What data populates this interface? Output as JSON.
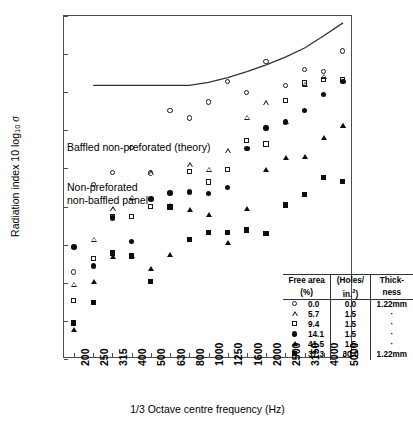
{
  "chart_data": {
    "type": "scatter",
    "title": "",
    "xlabel": "1/3 Octave centre frequency (Hz)",
    "ylabel_parts": {
      "pre": "Radiation index 10 log",
      "sub": "10",
      "sym": "σ"
    },
    "ylabel": "Radiation index 10 log10 σ",
    "categories": [
      200,
      250,
      315,
      400,
      500,
      630,
      800,
      1000,
      1250,
      1600,
      2000,
      2500,
      3150,
      4000,
      5000
    ],
    "xtick_labels": [
      "200",
      "250",
      "315",
      "400",
      "500",
      "630",
      "800",
      "1000",
      "1250",
      "1600",
      "2000",
      "2500",
      "3150",
      "4000",
      "5000"
    ],
    "ytick_labels": [
      "-10",
      "-15",
      "-20",
      "-25",
      "-30",
      "-35",
      "-40",
      "-45",
      "-50",
      "-55"
    ],
    "yticks": [
      -10,
      -15,
      -20,
      -25,
      -30,
      -35,
      -40,
      -45,
      -50,
      -55
    ],
    "ylim": [
      -55,
      -10
    ],
    "grid": false,
    "legend_position": "inside-bottom-right",
    "series": [
      {
        "name": "0.0",
        "marker": "circle-open",
        "values": [
          -43.6,
          -32.1,
          -30.5,
          -27.3,
          -30.6,
          -22.4,
          -23.4,
          -21.3,
          -18.6,
          -20.1,
          -16.0,
          -19.1,
          -17.0,
          -17.3,
          -14.6
        ]
      },
      {
        "name": "5.7",
        "marker": "triangle-open",
        "values": [
          -45.2,
          -39.3,
          -35.3,
          -33.8,
          -30.6,
          -34.9,
          -29.5,
          -30.1,
          -27.7,
          -23.3,
          -21.4,
          -23.9,
          -19.0,
          -17.9,
          -24.4
        ]
      },
      {
        "name": "9.4",
        "marker": "square-open",
        "values": [
          -47.3,
          -41.8,
          -36.3,
          -36.3,
          -35.0,
          -35.1,
          -30.4,
          -31.8,
          -30.1,
          -26.3,
          -26.8,
          -21.1,
          -18.8,
          -18.3,
          -18.4
        ]
      },
      {
        "name": "14.1",
        "marker": "circle-filled",
        "values": [
          -40.3,
          -42.8,
          -36.5,
          -39.6,
          -34.0,
          -33.2,
          -33.1,
          -33.3,
          -32.5,
          -27.4,
          -24.7,
          -23.9,
          -22.4,
          -20.3,
          -18.6
        ]
      },
      {
        "name": "41.5",
        "marker": "triangle-filled",
        "values": [
          -51.1,
          -44.8,
          -41.6,
          -41.5,
          -43.2,
          -41.3,
          -35.4,
          -36.1,
          -39.7,
          -35.3,
          -30.1,
          -28.6,
          -28.4,
          -26.0,
          -24.4
        ]
      },
      {
        "name": "37.3",
        "marker": "square-filled",
        "values": [
          -50.3,
          -47.6,
          -41.1,
          -41.5,
          -44.8,
          -35.0,
          -39.3,
          -38.4,
          -38.4,
          -38.1,
          -38.5,
          -34.8,
          -33.4,
          -31.2,
          -31.7
        ]
      }
    ],
    "theory_curve": {
      "name": "Baffled non-preforated (theory)",
      "x": [
        250,
        315,
        400,
        500,
        630,
        800,
        1000,
        1250,
        1600,
        2000,
        2500,
        3150,
        4000,
        5000
      ],
      "y": [
        -19.1,
        -19.1,
        -19.1,
        -19.1,
        -19.1,
        -19.1,
        -18.7,
        -18.1,
        -17.3,
        -16.4,
        -15.4,
        -14.2,
        -12.6,
        -10.9
      ]
    },
    "annotations": [
      {
        "name": "theory-label",
        "text": "Baffled non-preforated (theory)"
      },
      {
        "name": "panel-label-line1",
        "text": "Non-preforated"
      },
      {
        "name": "panel-label-line2",
        "text": "non-baffled panel"
      }
    ]
  },
  "legend": {
    "headers": {
      "col1_line1": "Free area",
      "col1_line2": "(%)",
      "col2_line1": "(Holes/",
      "col2_line2_pre": "in.",
      "col2_line2_sup": "2",
      "col2_line2_post": ")",
      "col3_line1": "Thick-",
      "col3_line2": "ness"
    },
    "rows": [
      {
        "marker": "circle-open",
        "free_area": "0.0",
        "holes": "0.0",
        "thickness": "1.22mm"
      },
      {
        "marker": "triangle-open",
        "free_area": "5.7",
        "holes": "1.5",
        "thickness": "·"
      },
      {
        "marker": "square-open",
        "free_area": "9.4",
        "holes": "1.5",
        "thickness": "·"
      },
      {
        "marker": "circle-filled",
        "free_area": "14.1",
        "holes": "1.5",
        "thickness": "·"
      },
      {
        "marker": "triangle-filled",
        "free_area": "41.5",
        "holes": "1.5",
        "thickness": "·"
      },
      {
        "marker": "square-filled",
        "free_area": "37.3",
        "holes": "30.0",
        "thickness": "1.22mm"
      }
    ]
  },
  "colors": {
    "axis": "#4d4d4d",
    "marker": "#0d0d0d",
    "curve": "#333333",
    "text": "#000000",
    "background": "#ffffff"
  }
}
